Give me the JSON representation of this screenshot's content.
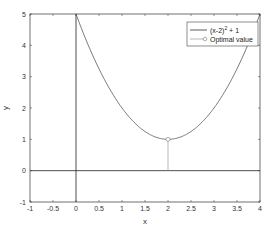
{
  "chart_data": {
    "type": "line",
    "title": "",
    "xlabel": "x",
    "ylabel": "y",
    "xlim": [
      -1,
      4
    ],
    "ylim": [
      -1,
      5
    ],
    "xticks": [
      "-1",
      "-0.5",
      "0",
      "0.5",
      "1",
      "1.5",
      "2",
      "2.5",
      "3",
      "3.5",
      "4"
    ],
    "yticks": [
      "-1",
      "0",
      "1",
      "2",
      "3",
      "4",
      "5"
    ],
    "grid": false,
    "legend_position": "upper right",
    "series": [
      {
        "name": "(x-2)^2 + 1",
        "kind": "line",
        "function": "(x-2)^2 + 1",
        "x": [
          0,
          0.5,
          1,
          1.5,
          2,
          2.5,
          3,
          3.5,
          4
        ],
        "y": [
          5,
          3.25,
          2,
          1.25,
          1,
          1.25,
          2,
          3.25,
          5
        ]
      },
      {
        "name": "Optimal value",
        "kind": "stem",
        "marker": "circle",
        "x": [
          2
        ],
        "y": [
          1
        ]
      }
    ],
    "reference_lines": [
      {
        "axis": "x",
        "value": 0
      },
      {
        "axis": "y",
        "value": 0
      }
    ]
  },
  "legend": {
    "entry1": "(x-2)",
    "entry1_sup": "2",
    "entry1_tail": " + 1",
    "entry2": "Optimal value"
  },
  "labels": {
    "x": "x",
    "y": "y"
  },
  "colors": {
    "curve": "#555555",
    "axes": "#333333",
    "stem": "#888888"
  }
}
